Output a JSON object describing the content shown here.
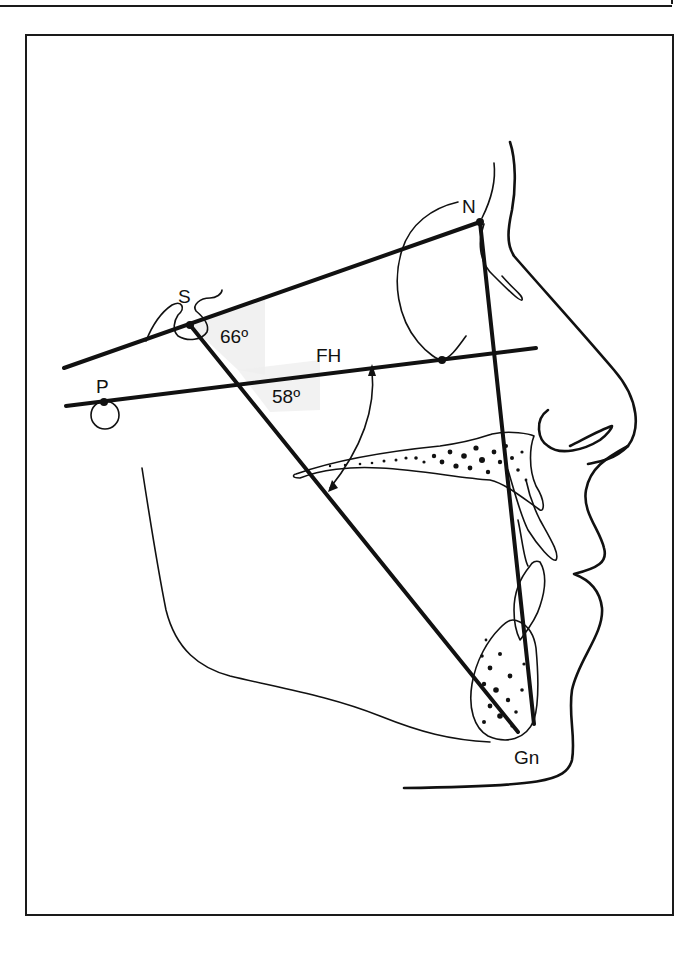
{
  "figure": {
    "type": "cephalometric tracing (lateral skull profile)",
    "landmarks": [
      {
        "id": "S",
        "label": "S",
        "name": "Sella"
      },
      {
        "id": "N",
        "label": "N",
        "name": "Nasion"
      },
      {
        "id": "P",
        "label": "P",
        "name": "Porion"
      },
      {
        "id": "Gn",
        "label": "Gn",
        "name": "Gnathion"
      }
    ],
    "planes": [
      {
        "id": "SN",
        "from": "S",
        "to": "N"
      },
      {
        "id": "FH",
        "label": "FH",
        "name": "Frankfort horizontal"
      },
      {
        "id": "SGn",
        "from": "S",
        "to": "Gn",
        "name": "Y-axis"
      },
      {
        "id": "NGn",
        "from": "N",
        "to": "Gn"
      }
    ],
    "angles": [
      {
        "id": "sn-sgn",
        "label": "66º",
        "between": [
          "SN",
          "SGn"
        ]
      },
      {
        "id": "fh-sgn",
        "label": "58º",
        "between": [
          "FH",
          "SGn"
        ]
      }
    ],
    "colors": {
      "ink": "#111111",
      "paper": "#ffffff",
      "angle_shade": "#eeeeee"
    }
  },
  "labels": {
    "S": "S",
    "N": "N",
    "P": "P",
    "Gn": "Gn",
    "FH": "FH",
    "angle_sn": "66º",
    "angle_fh": "58º"
  }
}
